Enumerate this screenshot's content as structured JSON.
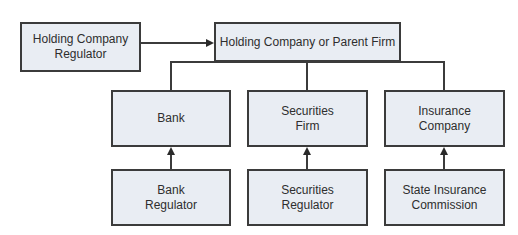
{
  "diagram": {
    "type": "organizational-regulatory-structure",
    "nodes": {
      "holding_regulator": {
        "label": "Holding Company\nRegulator"
      },
      "parent": {
        "label": "Holding Company or Parent Firm"
      },
      "bank": {
        "label": "Bank"
      },
      "securities": {
        "label": "Securities\nFirm"
      },
      "insurance": {
        "label": "Insurance\nCompany"
      },
      "bank_regulator": {
        "label": "Bank\nRegulator"
      },
      "securities_regulator": {
        "label": "Securities\nRegulator"
      },
      "insurance_regulator": {
        "label": "State Insurance\nCommission"
      }
    },
    "edges": [
      {
        "from": "Holding Company Regulator",
        "to": "Holding Company or Parent Firm",
        "type": "arrow"
      },
      {
        "from": "Holding Company or Parent Firm",
        "to": "Bank",
        "type": "line"
      },
      {
        "from": "Holding Company or Parent Firm",
        "to": "Securities Firm",
        "type": "line"
      },
      {
        "from": "Holding Company or Parent Firm",
        "to": "Insurance Company",
        "type": "line"
      },
      {
        "from": "Bank Regulator",
        "to": "Bank",
        "type": "arrow"
      },
      {
        "from": "Securities Regulator",
        "to": "Securities Firm",
        "type": "arrow"
      },
      {
        "from": "State Insurance Commission",
        "to": "Insurance Company",
        "type": "arrow"
      }
    ],
    "colors": {
      "box_fill": "#e9edf3",
      "border": "#3b3b3b",
      "text": "#2e2e2e"
    }
  }
}
